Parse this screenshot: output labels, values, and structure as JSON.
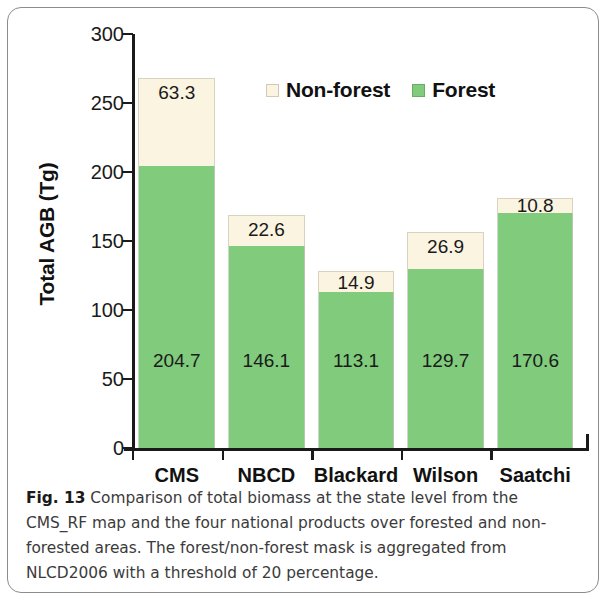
{
  "figure": {
    "caption_label": "Fig. 13",
    "caption_text": "Comparison of total biomass at the state level from the CMS_RF map and the four national products over forested and non-forested areas. The forest/non-forest mask is aggregated from NLCD2006 with a threshold of 20 percentage."
  },
  "legend": {
    "items": [
      {
        "label": "Non-forest",
        "color": "#faf4e1",
        "swatch": "nonforest-swatch-icon"
      },
      {
        "label": "Forest",
        "color": "#80cb7c",
        "swatch": "forest-swatch-icon"
      }
    ]
  },
  "chart_data": {
    "type": "bar",
    "subtype": "stacked",
    "title": "",
    "xlabel": "",
    "ylabel": "Total AGB (Tg)",
    "ylim": [
      0,
      300
    ],
    "yticks": [
      0,
      50,
      100,
      150,
      200,
      250,
      300
    ],
    "ytick_labels": [
      "0",
      "50",
      "100",
      "150",
      "200",
      "250",
      "300"
    ],
    "grid": false,
    "legend_position": "top-center",
    "categories": [
      "CMS",
      "NBCD",
      "Blackard",
      "Wilson",
      "Saatchi"
    ],
    "series": [
      {
        "name": "Forest",
        "color": "#80cb7c",
        "values": [
          204.7,
          146.1,
          113.1,
          129.7,
          170.6
        ],
        "labels": [
          "204.7",
          "146.1",
          "113.1",
          "129.7",
          "170.6"
        ]
      },
      {
        "name": "Non-forest",
        "color": "#faf4e1",
        "values": [
          63.3,
          22.6,
          14.9,
          26.9,
          10.8
        ],
        "labels": [
          "63.3",
          "22.6",
          "14.9",
          "26.9",
          "10.8"
        ]
      }
    ],
    "totals": [
      268.0,
      168.7,
      128.0,
      156.6,
      181.4
    ]
  }
}
